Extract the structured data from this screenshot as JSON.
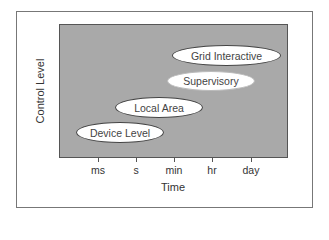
{
  "diagram": {
    "y_axis_label": "Control Level",
    "x_axis_label": "Time",
    "x_ticks": [
      "ms",
      "s",
      "min",
      "hr",
      "day"
    ],
    "levels": [
      {
        "label": "Grid Interactive"
      },
      {
        "label": "Supervisory"
      },
      {
        "label": "Local Area"
      },
      {
        "label": "Device Level"
      }
    ],
    "colors": {
      "plot_background": "#a9a9a9",
      "ellipse_fill": "#ffffff",
      "border": "#444444"
    }
  }
}
